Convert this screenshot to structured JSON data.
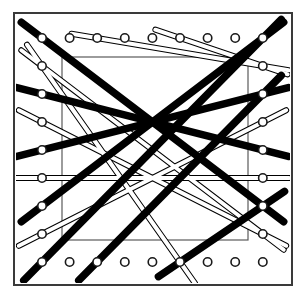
{
  "figure": {
    "kind": "technical-line-drawing",
    "width": 306,
    "height": 298,
    "background_color": "#ffffff"
  },
  "colors": {
    "ink": "#1a1a1a",
    "outer_frame_stroke": "#3a3a3a",
    "inner_rect_stroke": "#5a5a5a",
    "peg_stroke": "#1a1a1a",
    "peg_fill": "#ffffff",
    "thick_thread": "#000000",
    "thin_thread_stroke": "#000000",
    "thin_thread_fill": "#ffffff"
  },
  "outer_frame": {
    "label": "outer-frame",
    "x": 14,
    "y": 13,
    "width": 278,
    "height": 272,
    "stroke_width": 2.0
  },
  "inner_rect": {
    "label": "inner-rectangle",
    "x": 62,
    "y": 57,
    "width": 186,
    "height": 183,
    "stroke_width": 1.2
  },
  "peg_grid": {
    "label": "peg-grid",
    "columns": 9,
    "rows": 9,
    "x_start": 42,
    "y_start": 38,
    "x_spacing": 27.6,
    "y_spacing": 28.0,
    "peg_outer_radius": 4.2,
    "peg_inner_radius": 2.3,
    "perimeter_only": true,
    "total_visible_pegs": 32
  },
  "threads": {
    "thick": {
      "label": "thick-filament",
      "stroke_width": 7.5,
      "color": "#000000",
      "direction": "up-right diagonal",
      "pass_count": 7,
      "description": "Heavy dark filament zigzagging from lower-left pegs to upper-right pegs"
    },
    "thin": {
      "label": "thin-filament",
      "outer_stroke_width": 6.0,
      "inner_stroke_width": 4.0,
      "outline_color": "#000000",
      "fill_color": "#ffffff",
      "direction": "down-right diagonal",
      "pass_count": 7,
      "description": "Light outlined filament zigzagging from upper-left pegs to lower-right pegs"
    }
  },
  "thread_paths": {
    "thick_segments": [
      {
        "x1": 42,
        "y1": 262,
        "x2": 263,
        "y2": 38
      },
      {
        "x1": 42,
        "y1": 206,
        "x2": 263,
        "y2": 38
      },
      {
        "x1": 42,
        "y1": 150,
        "x2": 263,
        "y2": 94
      },
      {
        "x1": 42,
        "y1": 94,
        "x2": 263,
        "y2": 150
      },
      {
        "x1": 42,
        "y1": 38,
        "x2": 263,
        "y2": 206
      },
      {
        "x1": 97,
        "y1": 262,
        "x2": 263,
        "y2": 94
      },
      {
        "x1": 180,
        "y1": 262,
        "x2": 263,
        "y2": 206
      }
    ],
    "thin_segments": [
      {
        "x1": 42,
        "y1": 66,
        "x2": 263,
        "y2": 234
      },
      {
        "x1": 42,
        "y1": 122,
        "x2": 263,
        "y2": 234
      },
      {
        "x1": 42,
        "y1": 178,
        "x2": 263,
        "y2": 178
      },
      {
        "x1": 42,
        "y1": 234,
        "x2": 263,
        "y2": 122
      },
      {
        "x1": 97,
        "y1": 38,
        "x2": 263,
        "y2": 66
      },
      {
        "x1": 180,
        "y1": 38,
        "x2": 263,
        "y2": 66
      },
      {
        "x1": 42,
        "y1": 66,
        "x2": 180,
        "y2": 262
      }
    ]
  },
  "anchor_pegs": {
    "left_column_used_y": [
      66,
      122,
      178,
      234
    ],
    "right_column_used_y": [
      66,
      122,
      178,
      234
    ],
    "top_row_used_x": [
      97,
      124,
      152,
      180,
      207
    ],
    "bottom_row_used_x": [
      97,
      124,
      152,
      180,
      207
    ]
  }
}
